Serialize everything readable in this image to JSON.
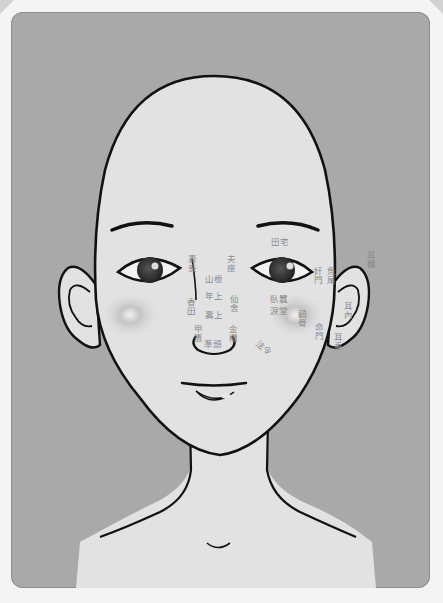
{
  "diagram": {
    "caption_top": "",
    "colors": {
      "background": "#a9a9a9",
      "skin": "#e2e2e2",
      "outline": "#111111",
      "label": "#8a8a8a",
      "page": "#f4f4f4"
    },
    "labels": {
      "tianzhai": "田宅",
      "qiqie": "妻妾",
      "fuzuo": "夫座",
      "shangen": "山根",
      "nianshang": "年上",
      "shoushang": "壽上",
      "xianshe": "仙舍",
      "xiangtian": "香田",
      "jiagui": "甲匱",
      "zhuntou": "準頭",
      "jingui": "金櫃",
      "faling": "法令",
      "wocan": "臥蠶",
      "leitang": "淚堂",
      "quangu": "顴骨",
      "mingmen": "命門",
      "jianmen": "奸門",
      "yuwei": "魚尾",
      "erlun": "耳輪",
      "ernei": "耳內",
      "erchui": "耳垂"
    }
  }
}
